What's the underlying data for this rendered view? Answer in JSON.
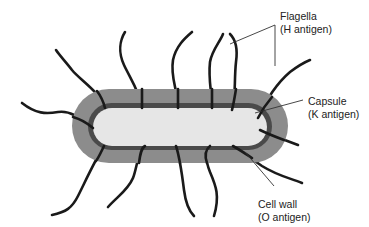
{
  "diagram": {
    "labels": {
      "flagella": {
        "line1": "Flagella",
        "line2": "(H antigen)"
      },
      "capsule": {
        "line1": "Capsule",
        "line2": "(K antigen)"
      },
      "cell_wall": {
        "line1": "Cell wall",
        "line2": "(O antigen)"
      }
    },
    "colors": {
      "capsule": "#8c8c8c",
      "cell_wall": "#4a4a4a",
      "cytoplasm": "#e6e6e6",
      "flagella": "#1a1a1a",
      "leader_line": "#333333"
    }
  }
}
